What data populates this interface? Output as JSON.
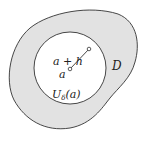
{
  "diagram": {
    "region_label": "D",
    "neighborhood_label": "U",
    "neighborhood_subscript": "δ",
    "neighborhood_arg": "(a)",
    "center_label": "a",
    "point_label": "a + h",
    "colors": {
      "region_fill": "#e2e2e2",
      "stroke": "#333333",
      "disk_fill": "#ffffff"
    }
  }
}
